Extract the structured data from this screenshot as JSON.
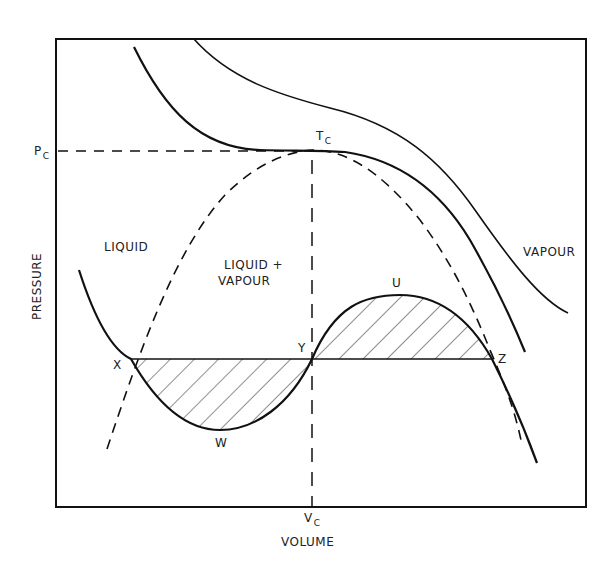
{
  "diagram": {
    "type": "pressure-volume isotherm diagram (van der Waals / Maxwell construction)",
    "axes": {
      "xlabel": "VOLUME",
      "ylabel": "PRESSURE",
      "x_tick": {
        "main": "V",
        "sub": "C"
      },
      "y_tick": {
        "main": "P",
        "sub": "C"
      }
    },
    "critical_point": {
      "main": "T",
      "sub": "C"
    },
    "regions": {
      "liquid": "LIQUID",
      "two_phase_line1": "LIQUID +",
      "two_phase_line2": "VAPOUR",
      "vapour": "VAPOUR"
    },
    "points": {
      "x": "X",
      "y": "Y",
      "z": "Z",
      "u": "U",
      "w": "W"
    },
    "colors": {
      "line": "#111111",
      "background": "#ffffff"
    }
  }
}
